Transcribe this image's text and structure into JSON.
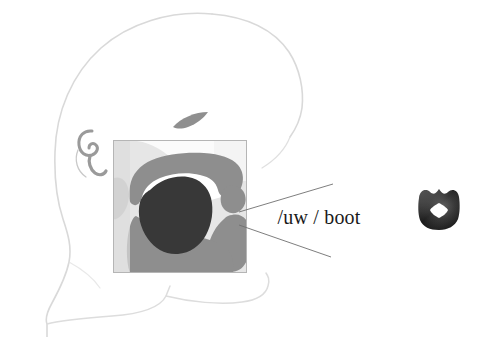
{
  "figure": {
    "background_color": "#ffffff",
    "width": 488,
    "height": 337
  },
  "label": {
    "text": "/uw / boot",
    "phoneme": "/uw /",
    "example_word": "boot",
    "color": "#1a1a1a"
  },
  "head_profile": {
    "name": "head-outline",
    "stroke_color": "#d8d8d8",
    "fill_color": "#fefefe",
    "parts": [
      {
        "name": "skull-and-face-outline",
        "color": "#d8d8d8"
      },
      {
        "name": "neck-outline",
        "color": "#d8d8d8"
      },
      {
        "name": "jaw-chin-outline",
        "color": "#dcdcdc"
      }
    ]
  },
  "facial_features": {
    "eye": {
      "name": "eye",
      "color": "#8f8f8f"
    },
    "ear": {
      "name": "ear",
      "color": "#9a9a9a"
    }
  },
  "sagittal_section": {
    "name": "vocal-tract-section",
    "border_color": "#b8b8b8",
    "background_color": "#e8e8e8",
    "bounds": {
      "x": 113,
      "y": 140,
      "width": 134,
      "height": 133
    },
    "structures": [
      {
        "name": "oral-cavity-airway",
        "color": "#fafafa"
      },
      {
        "name": "nasal-cavity",
        "color": "#f2f2f2"
      },
      {
        "name": "hard-palate-and-velum",
        "color": "#8e8e8e"
      },
      {
        "name": "uvula",
        "color": "#8e8e8e"
      },
      {
        "name": "pharyngeal-wall",
        "color": "#8e8e8e"
      },
      {
        "name": "tongue-body",
        "color": "#383838"
      },
      {
        "name": "lower-jaw-floor",
        "color": "#8e8e8e"
      },
      {
        "name": "lips-profile",
        "color": "#8e8e8e"
      }
    ]
  },
  "pointer_lines": {
    "name": "leader-lines",
    "color": "#6f6f6f",
    "count": 2,
    "lines": [
      {
        "name": "pointer-to-velum",
        "from": [
          240,
          212
        ],
        "to": [
          332,
          185
        ]
      },
      {
        "name": "pointer-to-tongue-back",
        "from": [
          240,
          224
        ],
        "to": [
          330,
          256
        ]
      }
    ]
  },
  "lip_shape": {
    "name": "lip-rounding-diagram",
    "description": "rounded lips with small diamond aperture",
    "outer_color": "#1f1f1f",
    "aperture_color": "#ffffff",
    "bounds": {
      "x": 419,
      "y": 188,
      "width": 40,
      "height": 41
    }
  }
}
